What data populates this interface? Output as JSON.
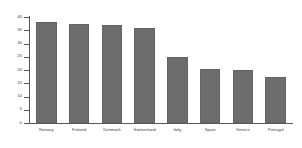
{
  "chart_data": {
    "type": "bar",
    "title": "",
    "subtitle": "",
    "xlabel": "",
    "ylabel": "",
    "categories": [
      "Norway",
      "Finland",
      "Denmark",
      "Switzerland",
      "Italy",
      "Spain",
      "Greece",
      "Portugal"
    ],
    "values": [
      38,
      37.5,
      37,
      36,
      25,
      20.5,
      20,
      17.5
    ],
    "ylim": [
      0,
      40
    ],
    "yticks": [
      0,
      5,
      10,
      15,
      20,
      25,
      30,
      35,
      40
    ],
    "ytick_labels": [
      "0",
      "5",
      "10",
      "15",
      "20",
      "25",
      "30",
      "35",
      "40"
    ],
    "grid": false,
    "legend": false,
    "legend_position": "none",
    "annotations": [],
    "colors": {
      "bar": "#6d6d6d",
      "bar_edge": "#636363",
      "axis": "#5a5a5a",
      "text": "#4a4a4a",
      "background": "#fefefe"
    }
  }
}
